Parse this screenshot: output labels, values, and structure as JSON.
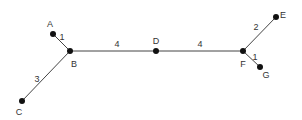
{
  "diagram": {
    "type": "weighted-tree",
    "nodes": [
      {
        "id": "A",
        "label": "A",
        "x": 53,
        "y": 34,
        "lx": 50,
        "ly": 25
      },
      {
        "id": "B",
        "label": "B",
        "x": 70,
        "y": 51,
        "lx": 74,
        "ly": 65
      },
      {
        "id": "C",
        "label": "C",
        "x": 22,
        "y": 101,
        "lx": 19,
        "ly": 113
      },
      {
        "id": "D",
        "label": "D",
        "x": 156,
        "y": 51,
        "lx": 156,
        "ly": 42
      },
      {
        "id": "F",
        "label": "F",
        "x": 243,
        "y": 51,
        "lx": 243,
        "ly": 65
      },
      {
        "id": "E",
        "label": "E",
        "x": 276,
        "y": 17,
        "lx": 283,
        "ly": 16
      },
      {
        "id": "G",
        "label": "G",
        "x": 260,
        "y": 67,
        "lx": 266,
        "ly": 76
      }
    ],
    "edges": [
      {
        "from": "A",
        "to": "B",
        "weight": "1",
        "lx": 62,
        "ly": 38
      },
      {
        "from": "B",
        "to": "C",
        "weight": "3",
        "lx": 37,
        "ly": 80
      },
      {
        "from": "B",
        "to": "D",
        "weight": "4",
        "lx": 117,
        "ly": 45
      },
      {
        "from": "D",
        "to": "F",
        "weight": "4",
        "lx": 200,
        "ly": 45
      },
      {
        "from": "F",
        "to": "E",
        "weight": "2",
        "lx": 256,
        "ly": 28
      },
      {
        "from": "F",
        "to": "G",
        "weight": "1",
        "lx": 255,
        "ly": 58
      }
    ]
  }
}
